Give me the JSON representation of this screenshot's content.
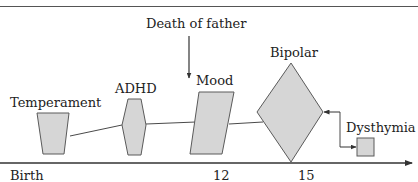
{
  "diagram": {
    "type": "developmental-timeline",
    "colors": {
      "shape_fill": "#d6d6d6",
      "shape_stroke": "#5a5a5a",
      "line": "#333333",
      "text": "#222222"
    },
    "nodes": [
      {
        "id": "temperament",
        "label": "Temperament",
        "shape": "trapezoid"
      },
      {
        "id": "adhd",
        "label": "ADHD",
        "shape": "hexagon"
      },
      {
        "id": "mood",
        "label": "Mood",
        "shape": "parallelogram"
      },
      {
        "id": "bipolar",
        "label": "Bipolar",
        "shape": "diamond"
      },
      {
        "id": "dysthymia",
        "label": "Dysthymia",
        "shape": "square"
      }
    ],
    "event": {
      "label": "Death of father",
      "points_to": "mood"
    },
    "edges": [
      {
        "from": "temperament",
        "to": "adhd"
      },
      {
        "from": "adhd",
        "to": "mood"
      },
      {
        "from": "mood",
        "to": "bipolar"
      },
      {
        "from": "dysthymia",
        "to": "bipolar",
        "bidirectional": true
      }
    ],
    "axis": {
      "ticks": [
        {
          "label": "Birth"
        },
        {
          "label": "12"
        },
        {
          "label": "15"
        }
      ]
    }
  }
}
